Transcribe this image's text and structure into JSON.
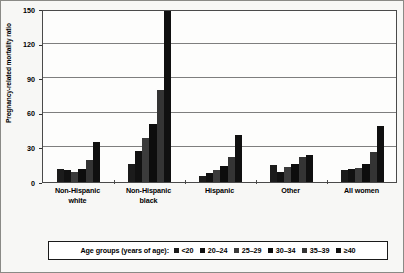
{
  "chart_data": {
    "type": "bar",
    "title": "",
    "subtitle": "",
    "xlabel": "",
    "ylabel": "Pregnancy-related mortality ratio",
    "ylim": [
      0,
      150
    ],
    "yticks": [
      0,
      30,
      60,
      90,
      120,
      150
    ],
    "grid": true,
    "legend_position": "bottom",
    "legend_title": "Age groups (years of age):",
    "categories": [
      "Non-Hispanic white",
      "Non-Hispanic black",
      "Hispanic",
      "Other",
      "All women"
    ],
    "category_lines": [
      [
        "Non-Hispanic",
        "white"
      ],
      [
        "Non-Hispanic",
        "black"
      ],
      [
        "Hispanic",
        ""
      ],
      [
        "Other",
        ""
      ],
      [
        "All women",
        ""
      ]
    ],
    "series": [
      {
        "name": "<20",
        "color": "#1b1b1b",
        "values": [
          11,
          16,
          5,
          15,
          10
        ]
      },
      {
        "name": "20–24",
        "color": "#111111",
        "values": [
          10,
          27,
          8,
          9,
          11
        ]
      },
      {
        "name": "25–29",
        "color": "#3b3b3b",
        "values": [
          9,
          38,
          10,
          13,
          12
        ]
      },
      {
        "name": "30–34",
        "color": "#0d0d0d",
        "values": [
          11,
          50,
          14,
          16,
          16
        ]
      },
      {
        "name": "35–39",
        "color": "#343434",
        "values": [
          19,
          80,
          22,
          22,
          26
        ]
      },
      {
        "name": "≥40",
        "color": "#101010",
        "values": [
          35,
          148,
          41,
          23,
          49
        ]
      }
    ]
  },
  "figure": {
    "border_color": "#8a8a86",
    "plot_background": "#fdfdfc",
    "gridline_color": "#7e7e7e"
  }
}
